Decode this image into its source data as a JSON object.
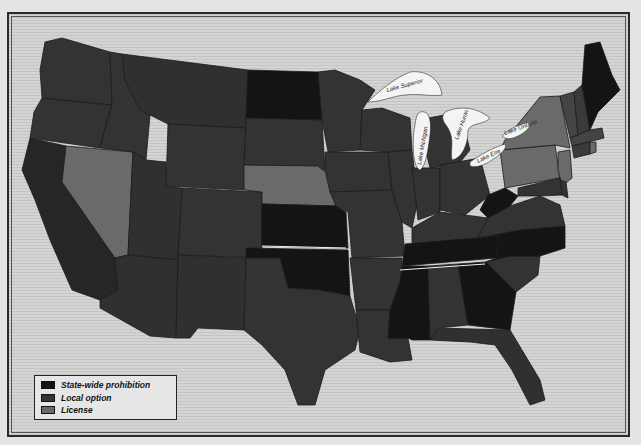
{
  "map": {
    "title": "",
    "subject": "Liquor law status by U.S. state",
    "colors": {
      "state_wide_prohibition": "#141414",
      "local_option": "#333333",
      "license": "#6a6a6a",
      "water": "#d4d4d4",
      "lake": "#f4f4f4"
    },
    "legend": {
      "items": [
        {
          "key": "state_wide_prohibition",
          "label": "State-wide prohibition"
        },
        {
          "key": "local_option",
          "label": "Local option"
        },
        {
          "key": "license",
          "label": "License"
        }
      ]
    },
    "lakes": [
      {
        "name": "Lake Superior",
        "label": "Lake Superior"
      },
      {
        "name": "Lake Michigan",
        "label": "Lake Michigan"
      },
      {
        "name": "Lake Huron",
        "label": "Lake Huron"
      },
      {
        "name": "Lake Erie",
        "label": "Lake Erie"
      },
      {
        "name": "Lake Ontario",
        "label": "Lake Ontario"
      }
    ],
    "states": {
      "state_wide_prohibition": [
        "North Dakota",
        "Kansas",
        "Oklahoma",
        "Tennessee",
        "North Carolina",
        "Mississippi",
        "Georgia",
        "West Virginia",
        "Maine"
      ],
      "license": [
        "Nevada",
        "Nebraska",
        "New York",
        "Pennsylvania",
        "New Jersey",
        "Rhode Island"
      ],
      "local_option": [
        "Washington",
        "Oregon",
        "California",
        "Idaho",
        "Montana",
        "Wyoming",
        "Utah",
        "Arizona",
        "Colorado",
        "New Mexico",
        "South Dakota",
        "Texas",
        "Minnesota",
        "Iowa",
        "Missouri",
        "Arkansas",
        "Louisiana",
        "Wisconsin",
        "Michigan",
        "Illinois",
        "Indiana",
        "Ohio",
        "Kentucky",
        "Alabama",
        "Virginia",
        "South Carolina",
        "Florida",
        "Maryland",
        "Delaware",
        "Vermont",
        "New Hampshire",
        "Massachusetts",
        "Connecticut"
      ]
    }
  }
}
